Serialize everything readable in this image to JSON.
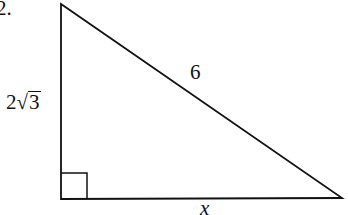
{
  "problem": {
    "number": "2.",
    "figure": "right-triangle",
    "labels": {
      "hypotenuse": "6",
      "vertical_leg_coefficient": "2",
      "vertical_leg_radical_symbol": "√",
      "vertical_leg_radicand": "3",
      "horizontal_leg": "x"
    },
    "right_angle_marker": "bottom-left"
  },
  "colors": {
    "stroke": "#111111",
    "background": "#ffffff"
  }
}
